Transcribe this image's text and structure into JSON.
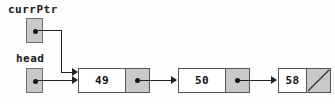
{
  "diagram": {
    "colors": {
      "node_fill": "#ffffff",
      "pointer_cell_fill": "#c9c9c9",
      "pointer_box_fill": "#c9c9c9",
      "border": "#555555",
      "line": "#222222",
      "text": "#111111",
      "background": "#fdfdfd"
    },
    "pointers": [
      {
        "name": "currPtr",
        "label": "currPtr",
        "target": "node-1"
      },
      {
        "name": "head",
        "label": "head",
        "target": "node-1"
      }
    ],
    "nodes": [
      {
        "id": "node-1",
        "value": "49",
        "next": "node-2",
        "null_terminated": false
      },
      {
        "id": "node-2",
        "value": "50",
        "next": "node-3",
        "null_terminated": false
      },
      {
        "id": "node-3",
        "value": "58",
        "next": "",
        "null_terminated": true
      }
    ]
  }
}
